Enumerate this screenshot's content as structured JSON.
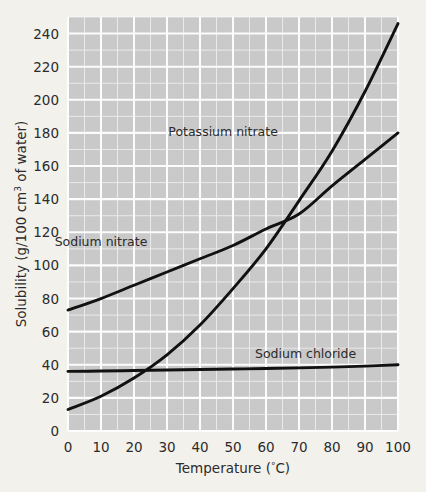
{
  "chart_data": {
    "type": "line",
    "title": "",
    "xlabel": "Temperature (°C)",
    "ylabel": "Solubility (g/100 cm³ of water)",
    "ylabel_main": "Solubility (g/100 cm",
    "ylabel_sup": "3",
    "ylabel_tail": " of water)",
    "xlabel_main": "Temperature (",
    "xlabel_deg": "°",
    "xlabel_tail": "C)",
    "xlim": [
      0,
      100
    ],
    "ylim": [
      0,
      250
    ],
    "xticks": [
      0,
      10,
      20,
      30,
      40,
      50,
      60,
      70,
      80,
      90,
      100
    ],
    "yticks": [
      0,
      20,
      40,
      60,
      80,
      100,
      120,
      140,
      160,
      180,
      200,
      220,
      240
    ],
    "xtick_labels": [
      "0",
      "10",
      "20",
      "30",
      "40",
      "50",
      "60",
      "70",
      "80",
      "90",
      "100"
    ],
    "ytick_labels": [
      "0",
      "20",
      "40",
      "60",
      "80",
      "100",
      "120",
      "140",
      "160",
      "180",
      "200",
      "220",
      "240"
    ],
    "grid": true,
    "grid_minor_step_x": 5,
    "grid_minor_step_y": 10,
    "grid_major_step_x": 10,
    "grid_major_step_y": 20,
    "legend": "inline-labels",
    "x": [
      0,
      10,
      20,
      30,
      40,
      50,
      60,
      70,
      80,
      90,
      100
    ],
    "series": [
      {
        "name": "Potassium nitrate",
        "label": "Potassium nitrate",
        "values": [
          13,
          21,
          32,
          46,
          64,
          86,
          110,
          139,
          169,
          205,
          246
        ],
        "color": "#111111"
      },
      {
        "name": "Sodium nitrate",
        "label": "Sodium nitrate",
        "values": [
          73,
          80,
          88,
          96,
          104,
          112,
          122,
          131,
          148,
          164,
          180
        ],
        "color": "#111111"
      },
      {
        "name": "Sodium chloride",
        "label": "Sodium chloride",
        "values": [
          36,
          36.2,
          36.5,
          36.8,
          37.1,
          37.4,
          37.7,
          38.1,
          38.6,
          39.2,
          40
        ],
        "color": "#111111"
      }
    ],
    "annotations": [
      {
        "text": "Potassium nitrate",
        "x": 47,
        "y": 178
      },
      {
        "text": "Sodium nitrate",
        "x": 10,
        "y": 112
      },
      {
        "text": "Sodium chloride",
        "x": 72,
        "y": 44
      }
    ],
    "intersection_note": {
      "x": 68,
      "y": 136
    }
  },
  "colors": {
    "page_background": "#f3f1ec",
    "plot_background": "#c9c9c9",
    "gridline": "#ffffff",
    "curve": "#111111",
    "text": "#2b2b2b"
  }
}
